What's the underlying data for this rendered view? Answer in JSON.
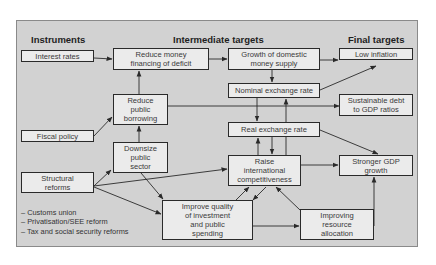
{
  "headers": {
    "instruments": "Instruments",
    "intermediate": "Intermediate targets",
    "final": "Final targets"
  },
  "nodes": {
    "interest_rates": "Interest rates",
    "fiscal_policy": "Fiscal policy",
    "structural_reforms": "Structural\nreforms",
    "reduce_money_financing": "Reduce money\nfinancing of deficit",
    "reduce_public_borrowing": "Reduce\npublic\nborrowing",
    "downsize_public_sector": "Downsize\npublic\nsector",
    "growth_money_supply": "Growth of domestic\nmoney supply",
    "nominal_exchange_rate": "Nominal exchange rate",
    "real_exchange_rate": "Real exchange rate",
    "raise_competitiveness": "Raise\ninternational\ncompetitiveness",
    "improve_quality_investment": "Improve quality\nof investment\nand public\nspending",
    "improving_resource_allocation": "Improving\nresource\nallocation",
    "low_inflation": "Low inflation",
    "sustainable_debt": "Sustainable debt\nto GDP ratios",
    "stronger_gdp_growth": "Stronger GDP\ngrowth"
  },
  "notes": [
    "– Customs union",
    "– Privatisation/SEE reform",
    "– Tax and social security reforms"
  ],
  "edges": [
    [
      "interest_rates",
      "reduce_money_financing"
    ],
    [
      "fiscal_policy",
      "reduce_public_borrowing"
    ],
    [
      "reduce_public_borrowing",
      "reduce_money_financing"
    ],
    [
      "reduce_public_borrowing",
      "sustainable_debt"
    ],
    [
      "downsize_public_sector",
      "reduce_public_borrowing"
    ],
    [
      "structural_reforms",
      "downsize_public_sector"
    ],
    [
      "structural_reforms",
      "raise_competitiveness"
    ],
    [
      "structural_reforms",
      "improve_quality_investment"
    ],
    [
      "downsize_public_sector",
      "improve_quality_investment"
    ],
    [
      "reduce_money_financing",
      "growth_money_supply"
    ],
    [
      "growth_money_supply",
      "low_inflation"
    ],
    [
      "growth_money_supply",
      "nominal_exchange_rate"
    ],
    [
      "nominal_exchange_rate",
      "low_inflation"
    ],
    [
      "nominal_exchange_rate",
      "real_exchange_rate"
    ],
    [
      "raise_competitiveness",
      "nominal_exchange_rate"
    ],
    [
      "real_exchange_rate",
      "raise_competitiveness"
    ],
    [
      "raise_competitiveness",
      "real_exchange_rate"
    ],
    [
      "real_exchange_rate",
      "stronger_gdp_growth"
    ],
    [
      "raise_competitiveness",
      "stronger_gdp_growth"
    ],
    [
      "improve_quality_investment",
      "raise_competitiveness"
    ],
    [
      "raise_competitiveness",
      "improve_quality_investment"
    ],
    [
      "improve_quality_investment",
      "improving_resource_allocation"
    ],
    [
      "improving_resource_allocation",
      "raise_competitiveness"
    ],
    [
      "improving_resource_allocation",
      "stronger_gdp_growth"
    ]
  ],
  "colors": {
    "panel_bg": "#d2d2d2",
    "box_bg": "#ebebeb",
    "line": "#2a2a2a"
  }
}
